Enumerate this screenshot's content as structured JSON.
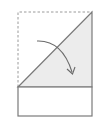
{
  "diagram": {
    "type": "origami-fold-step",
    "colors": {
      "background": "#ffffff",
      "paper_fill": "#ececec",
      "line": "#7a7a7a",
      "dashed_line": "#9a9a9a",
      "arrow": "#6a6a6a"
    },
    "original_outline": {
      "style": "dashed",
      "x1": 18,
      "y1": 12,
      "x2": 92,
      "y2": 87
    },
    "folded_triangle": {
      "points": [
        [
          18,
          87
        ],
        [
          92,
          12
        ],
        [
          92,
          87
        ]
      ]
    },
    "lower_rectangle": {
      "x": 18,
      "y": 87,
      "width": 74,
      "height": 29
    },
    "fold_arrow": {
      "start": [
        37,
        41
      ],
      "control": [
        62,
        42
      ],
      "end": [
        73,
        74
      ],
      "direction": "down-right"
    }
  }
}
